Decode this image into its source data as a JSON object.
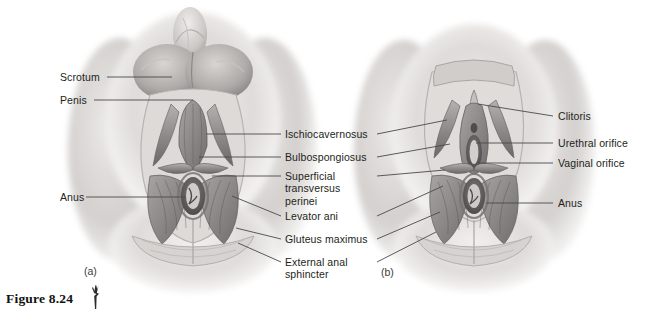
{
  "figure": {
    "caption": "Figure 8.24",
    "brush_icon": "brush-mark-icon",
    "panels": [
      {
        "tag": "(a)",
        "subject": "male-perineum"
      },
      {
        "tag": "(b)",
        "subject": "female-perineum"
      }
    ]
  },
  "labels": {
    "left": [
      {
        "text": "Scrotum",
        "name": "label-scrotum"
      },
      {
        "text": "Penis",
        "name": "label-penis"
      },
      {
        "text": "Anus",
        "name": "label-anus-left"
      }
    ],
    "center": [
      {
        "lines": [
          "Ischiocavernosus"
        ],
        "name": "label-ischiocavernosus"
      },
      {
        "lines": [
          "Bulbospongiosus"
        ],
        "name": "label-bulbospongiosus"
      },
      {
        "lines": [
          "Superficial",
          "transversus",
          "perinei"
        ],
        "name": "label-superficial-transversus-perinei"
      },
      {
        "lines": [
          "Levator ani"
        ],
        "name": "label-levator-ani"
      },
      {
        "lines": [
          "Gluteus maximus"
        ],
        "name": "label-gluteus-maximus"
      },
      {
        "lines": [
          "External anal",
          "sphincter"
        ],
        "name": "label-external-anal-sphincter"
      }
    ],
    "right": [
      {
        "text": "Clitoris",
        "name": "label-clitoris"
      },
      {
        "text": "Urethral orifice",
        "name": "label-urethral-orifice"
      },
      {
        "text": "Vaginal orifice",
        "name": "label-vaginal-orifice"
      },
      {
        "text": "Anus",
        "name": "label-anus-right"
      }
    ]
  },
  "colors": {
    "background": "#ffffff",
    "text": "#231f20",
    "leader_line": "#4a4a4a",
    "skin_light": "#e9e7e6",
    "skin_mid": "#c9c6c4",
    "muscle_mid": "#9a9896",
    "muscle_dark": "#6d6b6a",
    "shadow": "#4c4a49"
  }
}
